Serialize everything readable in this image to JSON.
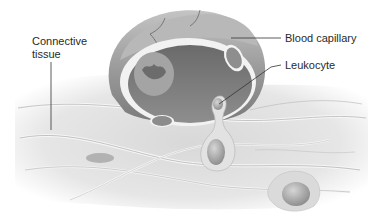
{
  "figure": {
    "labels": {
      "connective_tissue": "Connective tissue",
      "blood_capillary": "Blood capillary",
      "leukocyte": "Leukocyte"
    },
    "colors": {
      "background": "#ffffff",
      "tissue_light": "#e4e4e4",
      "tissue_mid": "#c8c8c8",
      "capillary_wall": "#9a9a9a",
      "capillary_dark": "#6e6e6e",
      "lumen": "#8a8a8a",
      "cell": "#a8a8a8",
      "leader_line": "#333333",
      "text": "#2a2a2a"
    }
  }
}
